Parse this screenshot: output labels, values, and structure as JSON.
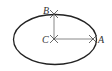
{
  "diagram": {
    "type": "ellipse-construction",
    "ellipse": {
      "cx": 55,
      "cy": 39.5,
      "rx": 41.5,
      "ry": 25
    },
    "points": [
      {
        "id": "A",
        "label": "A",
        "x": 93,
        "y": 39
      },
      {
        "id": "B",
        "label": "B",
        "x": 54,
        "y": 14
      },
      {
        "id": "C",
        "label": "C",
        "x": 54,
        "y": 39
      }
    ],
    "segments": [
      {
        "from": "C",
        "to": "A"
      },
      {
        "from": "C",
        "to": "B"
      }
    ],
    "colors": {
      "stroke": "#222222",
      "segment": "#888888",
      "mark": "#444444"
    }
  }
}
